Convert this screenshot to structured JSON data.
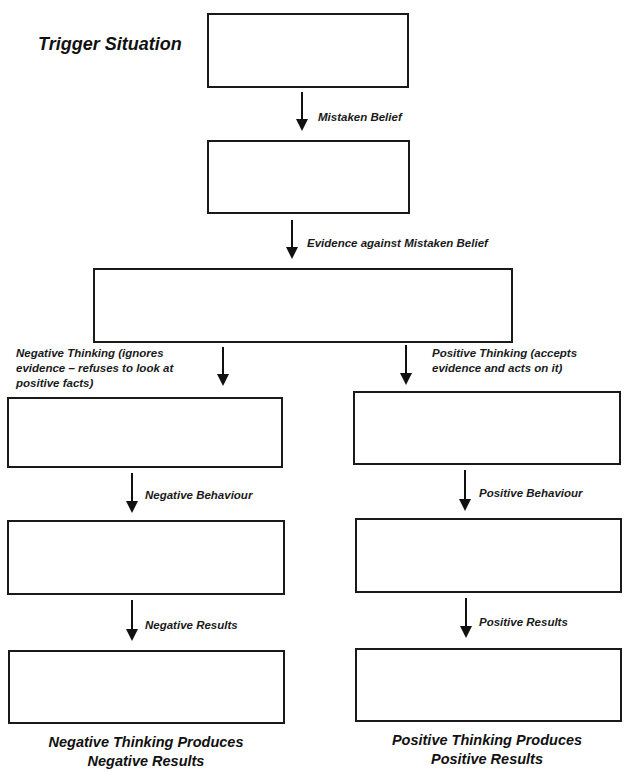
{
  "diagram": {
    "title": "Trigger Situation",
    "arrows": {
      "mistaken_belief": "Mistaken Belief",
      "evidence": "Evidence against Mistaken Belief",
      "negative_thinking": {
        "line1": "Negative Thinking (ignores",
        "line2": "evidence – refuses to look at",
        "line3": "positive facts)"
      },
      "positive_thinking": {
        "line1": "Positive Thinking (accepts",
        "line2": "evidence and acts on it)"
      },
      "negative_behaviour": "Negative Behaviour",
      "positive_behaviour": "Positive Behaviour",
      "negative_results": "Negative Results",
      "positive_results": "Positive Results"
    },
    "captions": {
      "negative": {
        "line1": "Negative Thinking Produces",
        "line2": "Negative Results"
      },
      "positive": {
        "line1": "Positive Thinking Produces",
        "line2": "Positive Results"
      }
    },
    "boxes": [
      {
        "id": "trigger-situation",
        "content": ""
      },
      {
        "id": "mistaken-belief",
        "content": ""
      },
      {
        "id": "evidence",
        "content": ""
      },
      {
        "id": "negative-thinking",
        "content": ""
      },
      {
        "id": "positive-thinking",
        "content": ""
      },
      {
        "id": "negative-behaviour",
        "content": ""
      },
      {
        "id": "positive-behaviour",
        "content": ""
      },
      {
        "id": "negative-results",
        "content": ""
      },
      {
        "id": "positive-results",
        "content": ""
      }
    ]
  }
}
